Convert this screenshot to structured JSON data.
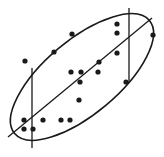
{
  "chart_data": {
    "type": "scatter",
    "title": "",
    "xlabel": "",
    "ylabel": "",
    "grid": false,
    "legend": null,
    "axes_visible": false,
    "colors": {
      "ink": "#1a1a1a",
      "background": "#ffffff"
    },
    "points": [
      {
        "x": 25,
        "y": 61
      },
      {
        "x": 54,
        "y": 52
      },
      {
        "x": 72,
        "y": 34
      },
      {
        "x": 117,
        "y": 24
      },
      {
        "x": 117,
        "y": 33
      },
      {
        "x": 153,
        "y": 35
      },
      {
        "x": 99,
        "y": 62
      },
      {
        "x": 117,
        "y": 53
      },
      {
        "x": 71,
        "y": 72
      },
      {
        "x": 81,
        "y": 72
      },
      {
        "x": 98,
        "y": 72
      },
      {
        "x": 80,
        "y": 82
      },
      {
        "x": 79,
        "y": 100
      },
      {
        "x": 126,
        "y": 82
      },
      {
        "x": 24,
        "y": 120
      },
      {
        "x": 43,
        "y": 120
      },
      {
        "x": 61,
        "y": 120
      },
      {
        "x": 70,
        "y": 120
      },
      {
        "x": 24,
        "y": 129
      },
      {
        "x": 33,
        "y": 129
      }
    ],
    "ellipse": {
      "cx": 82,
      "cy": 77,
      "rx": 88,
      "ry": 37,
      "rotation_deg": -40
    },
    "major_axis_line": {
      "x1": 8,
      "y1": 137,
      "x2": 152,
      "y2": 18
    },
    "vertical_lines": [
      {
        "x": 32,
        "y1": 68,
        "y2": 148
      },
      {
        "x": 129,
        "y1": 8,
        "y2": 83
      }
    ]
  }
}
